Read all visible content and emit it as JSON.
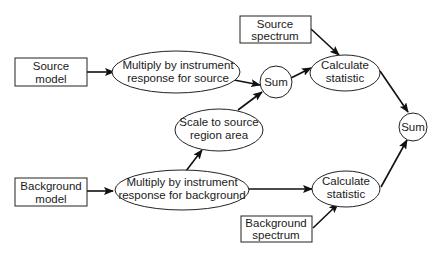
{
  "diagram": {
    "type": "flowchart",
    "nodes": [
      {
        "id": "source_model",
        "shape": "box",
        "lines": [
          "Source",
          "model"
        ]
      },
      {
        "id": "mult_source",
        "shape": "ellipse",
        "lines": [
          "Multiply by instrument",
          "response for source"
        ]
      },
      {
        "id": "sum_top",
        "shape": "circle",
        "lines": [
          "Sum"
        ]
      },
      {
        "id": "source_spectrum",
        "shape": "box",
        "lines": [
          "Source",
          "spectrum"
        ]
      },
      {
        "id": "calc_top",
        "shape": "ellipse",
        "lines": [
          "Calculate",
          "statistic"
        ]
      },
      {
        "id": "scale",
        "shape": "ellipse",
        "lines": [
          "Scale to source",
          "region area"
        ]
      },
      {
        "id": "sum_final",
        "shape": "circle",
        "lines": [
          "Sum"
        ]
      },
      {
        "id": "background_model",
        "shape": "box",
        "lines": [
          "Background",
          "model"
        ]
      },
      {
        "id": "mult_background",
        "shape": "ellipse",
        "lines": [
          "Multiply by instrument",
          "response for background"
        ]
      },
      {
        "id": "calc_bottom",
        "shape": "ellipse",
        "lines": [
          "Calculate",
          "statistic"
        ]
      },
      {
        "id": "background_spectrum",
        "shape": "box",
        "lines": [
          "Background",
          "spectrum"
        ]
      }
    ],
    "edges": [
      {
        "from": "source_model",
        "to": "mult_source"
      },
      {
        "from": "mult_source",
        "to": "sum_top"
      },
      {
        "from": "scale",
        "to": "sum_top"
      },
      {
        "from": "sum_top",
        "to": "calc_top"
      },
      {
        "from": "source_spectrum",
        "to": "calc_top"
      },
      {
        "from": "calc_top",
        "to": "sum_final"
      },
      {
        "from": "background_model",
        "to": "mult_background"
      },
      {
        "from": "mult_background",
        "to": "scale"
      },
      {
        "from": "mult_background",
        "to": "calc_bottom"
      },
      {
        "from": "background_spectrum",
        "to": "calc_bottom"
      },
      {
        "from": "calc_bottom",
        "to": "sum_final"
      }
    ]
  }
}
